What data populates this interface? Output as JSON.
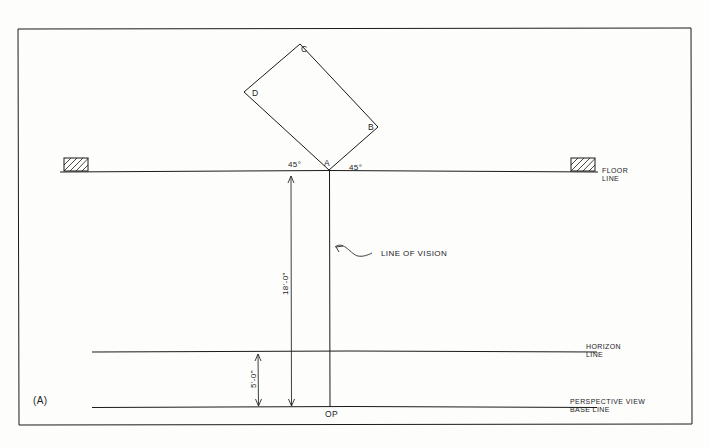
{
  "figure": {
    "label": "(A)",
    "type": "technical-perspective-layout-drawing",
    "frame": {
      "border_color": "#1a1a1a"
    },
    "square_object": {
      "vertices": [
        {
          "name": "A",
          "label": "A"
        },
        {
          "name": "B",
          "label": "B"
        },
        {
          "name": "C",
          "label": "C"
        },
        {
          "name": "D",
          "label": "D"
        }
      ]
    },
    "angles": [
      {
        "name": "left-angle",
        "label": "45°"
      },
      {
        "name": "right-angle",
        "label": "45°"
      }
    ],
    "lines": [
      {
        "name": "floor-line",
        "label_line_1": "FLOOR",
        "label_line_2": "LINE"
      },
      {
        "name": "horizon-line",
        "label_line_1": "HORIZON",
        "label_line_2": "LINE"
      },
      {
        "name": "perspective-view-base-line",
        "label_line_1": "PERSPECTIVE VIEW",
        "label_line_2": "BASE LINE"
      },
      {
        "name": "line-of-vision",
        "label": "LINE OF VISION"
      }
    ],
    "dimensions": [
      {
        "name": "station-distance",
        "label": "18'-0\""
      },
      {
        "name": "eye-height",
        "label": "5'-0\""
      }
    ],
    "points": [
      {
        "name": "observation-point",
        "label": "OP"
      }
    ]
  }
}
